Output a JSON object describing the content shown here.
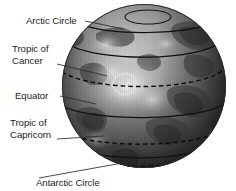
{
  "figure": {
    "background_color": "#ffffff",
    "ink_color": "#1c1c1c"
  },
  "globe": {
    "name": "earth-globe",
    "center_x": 144,
    "center_y": 86,
    "radius": 82,
    "style": "grayscale shaded sphere with continents and cloud texture"
  },
  "labels": [
    {
      "id": "arctic-circle",
      "text": "Arctic Circle",
      "lines": [
        "Arctic Circle"
      ],
      "text_x": 26,
      "text_y": 24,
      "leader": {
        "x1": 85,
        "y1": 21,
        "x2": 124,
        "y2": 29
      }
    },
    {
      "id": "tropic-of-cancer",
      "text": "Tropic of Cancer",
      "lines": [
        "Tropic of",
        "Cancer"
      ],
      "text_x": 12,
      "text_y": 52,
      "leader": {
        "x1": 57,
        "y1": 64,
        "x2": 107,
        "y2": 76
      }
    },
    {
      "id": "equator",
      "text": "Equator",
      "lines": [
        "Equator"
      ],
      "text_x": 15,
      "text_y": 99,
      "leader": {
        "x1": 60,
        "y1": 96,
        "x2": 96,
        "y2": 104
      }
    },
    {
      "id": "tropic-of-capricorn",
      "text": "Tropic of Capricorn",
      "lines": [
        "Tropic of",
        "Capricorn"
      ],
      "text_x": 10,
      "text_y": 126,
      "leader": {
        "x1": 57,
        "y1": 139,
        "x2": 104,
        "y2": 136
      }
    },
    {
      "id": "antarctic-circle",
      "text": "Antarctic Circle",
      "lines": [
        "Antarctic Circle"
      ],
      "text_x": 36,
      "text_y": 186,
      "leader": {
        "x1": 39,
        "y1": 178,
        "x2": 128,
        "y2": 162
      }
    }
  ],
  "latitude_lines": [
    {
      "id": "polar-cap-ring",
      "label": "Arctic polar cap ring",
      "style": "solid",
      "cy": 17
    },
    {
      "id": "arctic-circle-line",
      "label": "Arctic Circle",
      "style": "solid",
      "cy": 27
    },
    {
      "id": "mid-north-line",
      "label": "northern parallel",
      "style": "solid",
      "cy": 48
    },
    {
      "id": "tropic-of-cancer-line",
      "label": "Tropic of Cancer",
      "style": "dashed",
      "cy": 76
    },
    {
      "id": "equator-line",
      "label": "Equator",
      "style": "solid",
      "cy": 110
    },
    {
      "id": "tropic-of-capricorn-line",
      "label": "Tropic of Capricorn",
      "style": "dashed",
      "cy": 137
    },
    {
      "id": "southern-parallel-line",
      "label": "southern parallel",
      "style": "solid",
      "cy": 152
    },
    {
      "id": "antarctic-circle-line",
      "label": "Antarctic Circle",
      "style": "dashed",
      "cy": 161
    }
  ]
}
